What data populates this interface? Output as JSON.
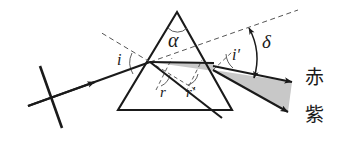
{
  "figure": {
    "background_color": "#ffffff",
    "ink_color": "#1a1a1a",
    "beam_fill_color": "#c8c8c8",
    "dashed_color": "#555555"
  },
  "labels": {
    "apex_angle": "α",
    "angle_of_incidence": "i",
    "angle_of_emergence": "i′",
    "refraction_angle_first": "r",
    "refraction_angle_second": "r′",
    "deviation_angle": "δ",
    "red_ray": "赤",
    "violet_ray": "紫"
  },
  "geometry": {
    "prism_apex": {
      "x": 177,
      "y": 12
    },
    "prism_bottom_left": {
      "x": 118,
      "y": 110
    },
    "prism_bottom_right": {
      "x": 232,
      "y": 110
    },
    "incidence_point": {
      "x": 150,
      "y": 62
    },
    "exit_point": {
      "x": 213,
      "y": 70
    },
    "incident_ray_start": {
      "x": 28,
      "y": 106
    },
    "wavefront_tick": {
      "x1": 40,
      "y1": 66,
      "x2": 62,
      "y2": 128
    },
    "red_ray_end": {
      "x": 292,
      "y": 80
    },
    "violet_ray_end": {
      "x": 288,
      "y": 110
    },
    "dashed_extension_end": {
      "x": 298,
      "y": 10
    },
    "dashed_normal_end": {
      "x": 100,
      "y": 32
    }
  },
  "elements": {
    "prism": "triangular-glass-prism",
    "incident_beam": "incoming-white-light-ray",
    "internal_beam": "refracted-beam-inside-prism",
    "emergent_beam": "dispersed-beam-red-to-violet",
    "deviation_arc": "double-headed-deviation-arrow"
  }
}
